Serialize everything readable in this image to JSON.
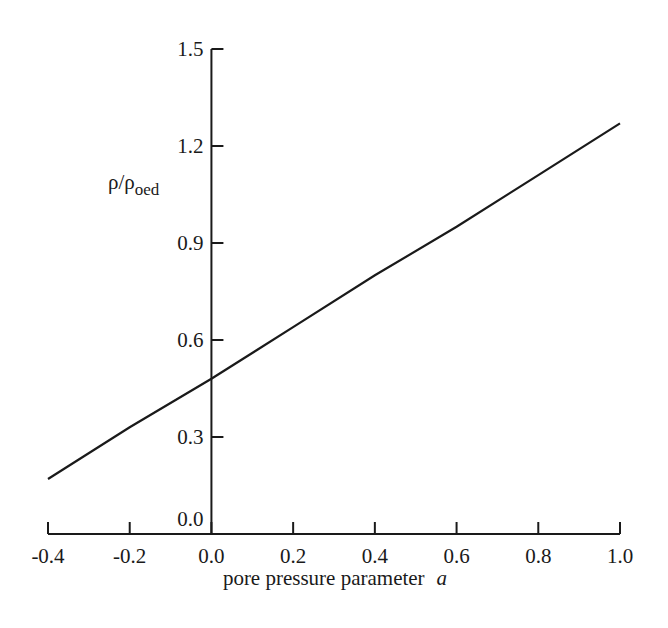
{
  "chart_data": {
    "type": "line",
    "title": "",
    "xlabel": "pore pressure parameter",
    "xlabel_italic_symbol": "a",
    "ylabel": "ρ/ρ_oed",
    "ylabel_main": "ρ/ρ",
    "ylabel_sub": "oed",
    "xlim": [
      -0.4,
      1.0
    ],
    "ylim": [
      0.0,
      1.5
    ],
    "xticks": [
      "-0.4",
      "-0.2",
      "0.0",
      "0.2",
      "0.4",
      "0.6",
      "0.8",
      "1.0"
    ],
    "yticks": [
      "0.0",
      "0.3",
      "0.6",
      "0.9",
      "1.2",
      "1.5"
    ],
    "grid": false,
    "legend": null,
    "series": [
      {
        "name": "ρ/ρoed vs a",
        "x": [
          -0.4,
          -0.2,
          0.0,
          0.2,
          0.4,
          0.6,
          0.8,
          1.0
        ],
        "y": [
          0.17,
          0.33,
          0.48,
          0.64,
          0.8,
          0.95,
          1.11,
          1.27
        ]
      }
    ],
    "line_color": "#1a1a1a"
  }
}
